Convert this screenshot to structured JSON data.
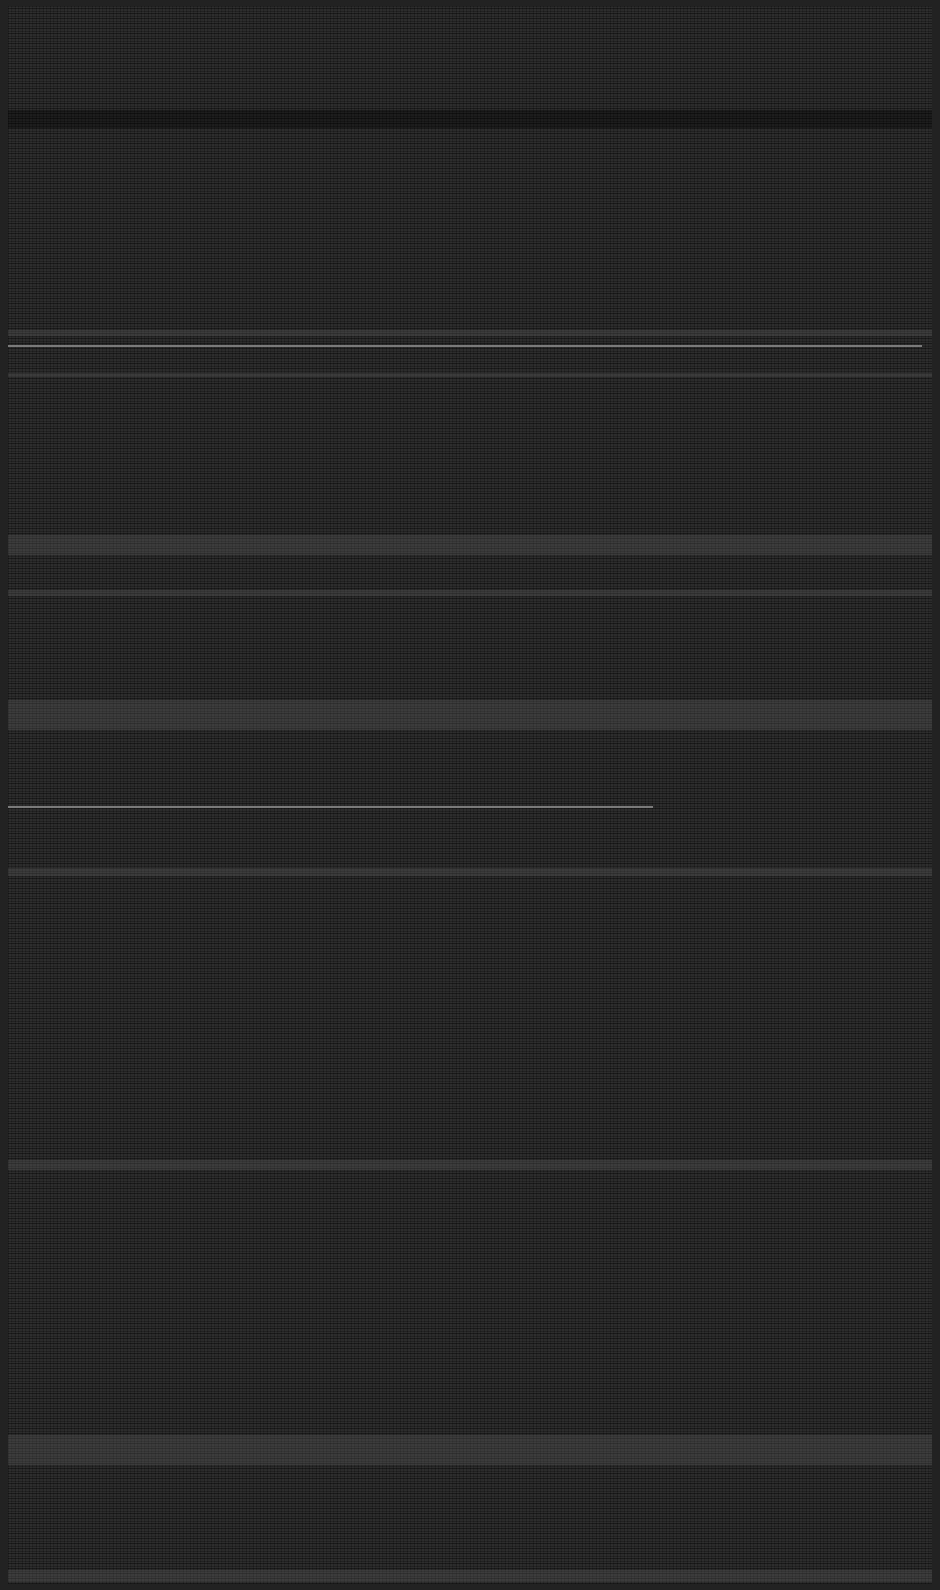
{
  "image": {
    "description": "Corrupted / glitched capture: dark grey noise field with horizontal streak bands; no legible UI text or controls",
    "width": 940,
    "height": 1590,
    "colors": {
      "frame": "#222222",
      "noise_base": "#262626",
      "scanline": "#8a8a8a"
    }
  },
  "bands": [
    {
      "type": "dark",
      "top": 110,
      "height": 18
    },
    {
      "type": "light",
      "top": 330,
      "height": 6
    },
    {
      "type": "light",
      "top": 373,
      "height": 4
    },
    {
      "type": "light",
      "top": 535,
      "height": 20
    },
    {
      "type": "light",
      "top": 590,
      "height": 6
    },
    {
      "type": "light",
      "top": 700,
      "height": 30
    },
    {
      "type": "light",
      "top": 868,
      "height": 8
    },
    {
      "type": "light",
      "top": 1160,
      "height": 10
    },
    {
      "type": "light",
      "top": 1435,
      "height": 30
    },
    {
      "type": "light",
      "top": 1570,
      "height": 12
    }
  ],
  "scanlines": [
    {
      "top": 345,
      "left": 8,
      "width": 914
    },
    {
      "top": 806,
      "left": 8,
      "width": 645
    }
  ]
}
